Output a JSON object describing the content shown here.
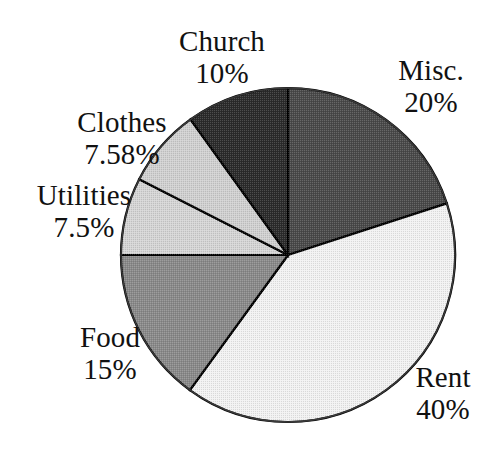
{
  "chart_data": {
    "type": "pie",
    "title": "",
    "subtitle": "",
    "xlabel": "",
    "ylabel": "",
    "legend_position": "none",
    "grid": false,
    "labels_inside": false,
    "start_angle_deg": 0,
    "direction": "clockwise",
    "categories": [
      "Misc.",
      "Rent",
      "Food",
      "Utilities",
      "Clothes",
      "Church"
    ],
    "values": [
      20,
      40,
      15,
      7.5,
      7.58,
      10
    ],
    "value_labels": [
      "20%",
      "40%",
      "15%",
      "7.5%",
      "7.58%",
      "10%"
    ],
    "colors": [
      "#4a4a4a",
      "#f2f2f2",
      "#8a8a8a",
      "#d5d5d5",
      "#d0d0d0",
      "#2b2b2b"
    ],
    "slices": [
      {
        "name": "Misc.",
        "value": 20,
        "value_label": "20%",
        "color": "#4a4a4a",
        "start_deg": 0,
        "end_deg": 72
      },
      {
        "name": "Rent",
        "value": 40,
        "value_label": "40%",
        "color": "#f2f2f2",
        "start_deg": 72,
        "end_deg": 216
      },
      {
        "name": "Food",
        "value": 15,
        "value_label": "15%",
        "color": "#8a8a8a",
        "start_deg": 216,
        "end_deg": 270
      },
      {
        "name": "Utilities",
        "value": 7.5,
        "value_label": "7.5%",
        "color": "#d5d5d5",
        "start_deg": 270,
        "end_deg": 297
      },
      {
        "name": "Clothes",
        "value": 7.58,
        "value_label": "7.58%",
        "color": "#d0d0d0",
        "start_deg": 297,
        "end_deg": 324.288
      },
      {
        "name": "Church",
        "value": 10,
        "value_label": "10%",
        "color": "#2b2b2b",
        "start_deg": 324.288,
        "end_deg": 360
      }
    ],
    "total": 100.08,
    "units": "percent",
    "outline_color": "#000000"
  },
  "labels": {
    "church": {
      "name": "Church",
      "value": "10%"
    },
    "misc": {
      "name": "Misc.",
      "value": "20%"
    },
    "clothes": {
      "name": "Clothes",
      "value": "7.58%"
    },
    "utilities": {
      "name": "Utilities",
      "value": "7.5%"
    },
    "food": {
      "name": "Food",
      "value": "15%"
    },
    "rent": {
      "name": "Rent",
      "value": "40%"
    }
  }
}
